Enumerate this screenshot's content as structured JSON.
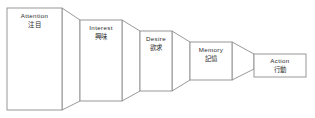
{
  "diagram": {
    "line_color": "#8d8d8d",
    "fill_color": "#ffffff",
    "text_color": "#2b2b2b",
    "stages": [
      {
        "id": "attention",
        "label_en": "Attention",
        "label_ja": "注目"
      },
      {
        "id": "interest",
        "label_en": "Interest",
        "label_ja": "興味"
      },
      {
        "id": "desire",
        "label_en": "Desire",
        "label_ja": "欲求"
      },
      {
        "id": "memory",
        "label_en": "Memory",
        "label_ja": "記憶"
      },
      {
        "id": "action",
        "label_en": "Action",
        "label_ja": "行動"
      }
    ]
  }
}
